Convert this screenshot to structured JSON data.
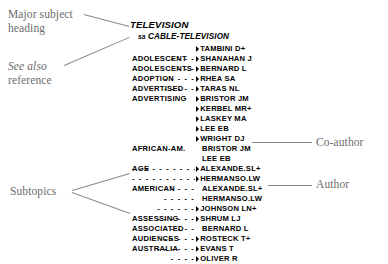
{
  "figure": {
    "background": "#ffffff",
    "ink": "#000000",
    "callout_color": "#6b6b6b",
    "leader_color": "#8a8a8a"
  },
  "callouts": [
    {
      "id": "major-subject-heading",
      "text": "Major subject\nheading",
      "italic": false,
      "x": 8,
      "y": 8
    },
    {
      "id": "see-also-reference",
      "text": "See also",
      "second_line": "reference",
      "italic": true,
      "x": 8,
      "y": 60
    },
    {
      "id": "subtopics",
      "text": "Subtopics",
      "italic": false,
      "x": 10,
      "y": 185
    },
    {
      "id": "co-author",
      "text": "Co-author",
      "italic": false,
      "x": 316,
      "y": 136
    },
    {
      "id": "author",
      "text": "Author",
      "italic": false,
      "x": 316,
      "y": 178
    }
  ],
  "leaders": [
    {
      "id": "leader-major-heading",
      "x1": 84,
      "y1": 14,
      "x2": 129,
      "y2": 26
    },
    {
      "id": "leader-see-also",
      "x1": 64,
      "y1": 65,
      "x2": 129,
      "y2": 37
    },
    {
      "id": "leader-subtopics-1",
      "x1": 72,
      "y1": 190,
      "x2": 130,
      "y2": 173
    },
    {
      "id": "leader-subtopics-2",
      "x1": 72,
      "y1": 192,
      "x2": 130,
      "y2": 213
    },
    {
      "id": "leader-coauthor",
      "x1": 252,
      "y1": 142,
      "x2": 312,
      "y2": 142
    },
    {
      "id": "leader-author",
      "x1": 268,
      "y1": 185,
      "x2": 312,
      "y2": 185
    }
  ],
  "record": {
    "heading": {
      "label": "TELEVISION",
      "x": 130,
      "y": 19
    },
    "see_also": {
      "tag": "sa",
      "target": "CABLE-TELEVISION",
      "x": 138,
      "y": 32
    },
    "rows": [
      {
        "subtopic": "",
        "dots": "",
        "name": "TAMBINI D+",
        "role": "author",
        "y": 44
      },
      {
        "subtopic": "ADOLESCENT",
        "dots": "- - - -",
        "name": "SHANAHAN J",
        "role": "author",
        "y": 54
      },
      {
        "subtopic": "ADOLESCENTS",
        "dots": "- - -",
        "name": "BERNARD L",
        "role": "author",
        "y": 64
      },
      {
        "subtopic": "ADOPTION",
        "dots": "- - - - -",
        "name": "RHEA SA",
        "role": "author",
        "y": 74
      },
      {
        "subtopic": "ADVERTISED",
        "dots": "- - - - -",
        "name": "TARAS NL",
        "role": "author",
        "y": 84
      },
      {
        "subtopic": "ADVERTISING",
        "dots": "",
        "name": "BRISTOR JM",
        "role": "author",
        "y": 94
      },
      {
        "subtopic": "",
        "dots": "",
        "name": "KERBEL MR+",
        "role": "author",
        "y": 104
      },
      {
        "subtopic": "",
        "dots": "",
        "name": "LASKEY MA",
        "role": "author",
        "y": 114
      },
      {
        "subtopic": "",
        "dots": "",
        "name": "LEE EB",
        "role": "author",
        "y": 124
      },
      {
        "subtopic": "",
        "dots": "",
        "name": "WRIGHT DJ",
        "role": "author",
        "y": 134
      },
      {
        "subtopic": "AFRICAN-AM.",
        "dots": "",
        "name": "BRISTOR JM",
        "role": "coauthor",
        "y": 144
      },
      {
        "subtopic": "",
        "dots": "",
        "name": "LEE EB",
        "role": "coauthor",
        "y": 154
      },
      {
        "subtopic": "AGE",
        "dots": "- - - - - - - - - - - -",
        "name": "ALEXANDE.SL+",
        "role": "author",
        "y": 164
      },
      {
        "subtopic": "",
        "dots": "- - - - - - - - - - -",
        "name": "HERMANSO.LW",
        "role": "author",
        "y": 174
      },
      {
        "subtopic": "AMERICAN",
        "dots": "- - - - -",
        "name": "ALEXANDE.SL+",
        "role": "coauthor",
        "y": 184
      },
      {
        "subtopic": "",
        "dots": "- - - - -",
        "name": "HERMANSO.LW",
        "role": "coauthor",
        "y": 194
      },
      {
        "subtopic": "",
        "dots": "- - - - - -",
        "name": "JOHNSON LN+",
        "role": "author",
        "y": 204
      },
      {
        "subtopic": "ASSESSING",
        "dots": "- - - - - -",
        "name": "SHRUM LJ",
        "role": "author",
        "y": 214
      },
      {
        "subtopic": "ASSOCIATED",
        "dots": "- - - -",
        "name": "BERNARD L",
        "role": "coauthor",
        "y": 224
      },
      {
        "subtopic": "AUDIENCES",
        "dots": "- - - - -",
        "name": "ROSTECK T+",
        "role": "author",
        "y": 234
      },
      {
        "subtopic": "AUSTRALIA",
        "dots": "- - - - - -",
        "name": "EVANS T",
        "role": "author",
        "y": 244
      },
      {
        "subtopic": "",
        "dots": "- - - -",
        "name": "OLIVER R",
        "role": "author",
        "y": 254
      }
    ]
  }
}
